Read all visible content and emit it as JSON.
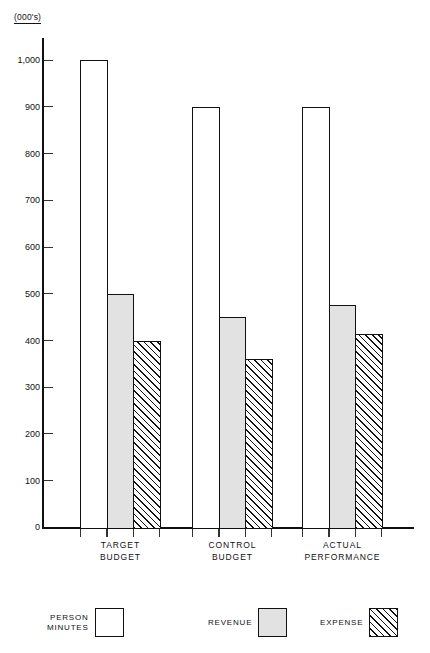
{
  "chart_data": {
    "type": "bar",
    "title": "",
    "subtitle": "",
    "units_label": "(000's)",
    "xlabel": "",
    "ylabel": "",
    "ylim": [
      0,
      1050
    ],
    "grid": false,
    "legend_position": "bottom",
    "categories": [
      "TARGET\nBUDGET",
      "CONTROL\nBUDGET",
      "ACTUAL\nPERFORMANCE"
    ],
    "y_ticks": [
      0,
      100,
      200,
      300,
      400,
      500,
      600,
      700,
      800,
      900,
      1000
    ],
    "y_tick_labels": [
      "0",
      "100",
      "200",
      "300",
      "400",
      "500",
      "600",
      "700",
      "800",
      "900",
      "1,000"
    ],
    "series": [
      {
        "name": "PERSON\nMINUTES",
        "fill": "white",
        "values": [
          1000,
          900,
          900
        ]
      },
      {
        "name": "REVENUE",
        "fill": "gray",
        "values": [
          500,
          450,
          475
        ]
      },
      {
        "name": "EXPENSE",
        "fill": "hatched",
        "values": [
          400,
          360,
          415
        ]
      }
    ]
  },
  "legend": {
    "items": [
      {
        "label": "PERSON\nMINUTES",
        "swatch": "person-minutes"
      },
      {
        "label": "REVENUE",
        "swatch": "revenue"
      },
      {
        "label": "EXPENSE",
        "swatch": "expense"
      }
    ]
  },
  "colors": {
    "axis": "#111111",
    "bar_outline": "#111111",
    "person_minutes_fill": "#ffffff",
    "revenue_fill": "#e2e2e2",
    "expense_fill": "#ffffff",
    "background": "#ffffff"
  }
}
